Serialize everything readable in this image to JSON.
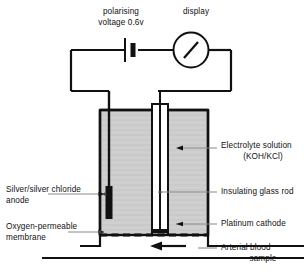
{
  "diagram": {
    "colors": {
      "stroke": "#111111",
      "leader_line": "#777777",
      "electrolyte_fill": "#cfcfcf",
      "glass_rod_fill": "#ffffff",
      "electrode_black": "#111111",
      "background": "#ffffff"
    },
    "labels": {
      "polarising_voltage": {
        "line1": "polarising",
        "line2": "voltage 0.6v",
        "name": "polarising-voltage-label"
      },
      "display": {
        "line1": "display",
        "name": "display-label"
      },
      "electrolyte_solution": {
        "line1": "Electrolyte solution",
        "line2": "(KOH/KCl)",
        "name": "electrolyte-solution-label"
      },
      "insulating_glass_rod": {
        "line1": "Insulating glass rod",
        "name": "insulating-glass-rod-label"
      },
      "platinum_cathode": {
        "line1": "Platinum cathode",
        "name": "platinum-cathode-label"
      },
      "arterial_blood_sample": {
        "line1": "Arterial blood",
        "line2": "sample",
        "name": "arterial-blood-sample-label"
      },
      "silver_chloride_anode": {
        "line1": "Silver/silver chloride",
        "line2": "anode",
        "name": "silver-silver-chloride-anode-label"
      },
      "oxygen_permeable_membrane": {
        "line1": "Oxygen-permeable",
        "line2": "membrane",
        "name": "oxygen-permeable-membrane-label"
      }
    },
    "components": {
      "battery_symbol": "battery-icon",
      "meter_symbol": "gauge-icon",
      "flow_arrow": "flow-arrow-icon",
      "membrane_symbol": "dashed-membrane-icon",
      "anode_symbol": "anode-bar-icon",
      "cathode_symbol": "cathode-tip-icon"
    }
  }
}
